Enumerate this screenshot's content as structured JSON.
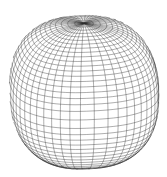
{
  "figure": {
    "type": "wireframe-surface",
    "colors": {
      "background": "#ffffff",
      "line": "#2a2a2a"
    },
    "mesh": {
      "lat_lines": 40,
      "lon_lines": 48,
      "exponent": 0.82,
      "radius": 74,
      "center_x": 84,
      "center_y": 92,
      "tilt_deg": 22,
      "rotate_deg": 8
    }
  }
}
